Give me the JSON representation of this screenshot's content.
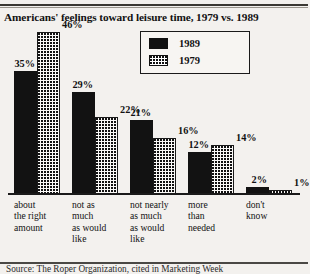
{
  "chart_data": {
    "type": "bar",
    "title": "Americans' feelings toward leisure time, 1979 vs. 1989",
    "xlabel": "",
    "ylabel": "",
    "ylim": [
      0,
      50
    ],
    "grid": false,
    "legend_position": "top-center",
    "categories": [
      "about the right amount",
      "not as much as would like",
      "not nearly as much as would like",
      "more than needed",
      "don't know"
    ],
    "category_lines": [
      [
        "about",
        "the right",
        "amount"
      ],
      [
        "not as",
        "much",
        "as would",
        "like"
      ],
      [
        "not nearly",
        "as much",
        "as would",
        "like"
      ],
      [
        "more",
        "than",
        "needed"
      ],
      [
        "don't",
        "know"
      ]
    ],
    "series": [
      {
        "name": "1989",
        "values": [
          35,
          29,
          21,
          12,
          2
        ],
        "fill": "solid",
        "color": "#121212"
      },
      {
        "name": "1979",
        "values": [
          46,
          22,
          16,
          14,
          1
        ],
        "fill": "dotted",
        "color": "#111111"
      }
    ],
    "value_labels": [
      [
        "35%",
        "46%"
      ],
      [
        "29%",
        "22%"
      ],
      [
        "21%",
        "16%"
      ],
      [
        "12%",
        "14%"
      ],
      [
        "2%",
        "1%"
      ]
    ]
  },
  "legend": {
    "items": [
      {
        "label": "1989",
        "pattern": "solid"
      },
      {
        "label": "1979",
        "pattern": "dotted"
      }
    ]
  },
  "footer": {
    "source": "Source: The Roper Organization, cited in Marketing Week"
  }
}
